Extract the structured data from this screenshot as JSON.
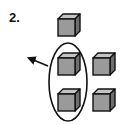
{
  "problem": {
    "number": "2."
  },
  "diagram": {
    "cube_face_color": "#9a9a9a",
    "cube_top_color": "#c4c4c4",
    "cube_side_color": "#6e6e6e",
    "stroke_color": "#111111",
    "cubes": [
      {
        "id": "top",
        "x": 58,
        "y": 14
      },
      {
        "id": "oval-upper",
        "x": 58,
        "y": 53
      },
      {
        "id": "oval-lower",
        "x": 58,
        "y": 89
      },
      {
        "id": "right-upper",
        "x": 93,
        "y": 53
      },
      {
        "id": "right-lower",
        "x": 93,
        "y": 89
      }
    ]
  }
}
